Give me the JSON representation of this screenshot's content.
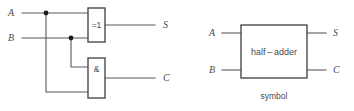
{
  "figure": {
    "background_color": "#ffffff",
    "line_color": "#595959",
    "text_color": "#4a4a4a"
  },
  "circuit": {
    "inputs": [
      {
        "label": "A"
      },
      {
        "label": "B"
      }
    ],
    "outputs": [
      {
        "label": "S"
      },
      {
        "label": "C"
      }
    ],
    "gates": [
      {
        "name": "xor-gate",
        "label": "=1"
      },
      {
        "name": "and-gate",
        "label": "&"
      }
    ]
  },
  "symbol": {
    "block_label": "half – adder",
    "caption": "symbol",
    "inputs": [
      {
        "label": "A"
      },
      {
        "label": "B"
      }
    ],
    "outputs": [
      {
        "label": "S"
      },
      {
        "label": "C"
      }
    ]
  }
}
